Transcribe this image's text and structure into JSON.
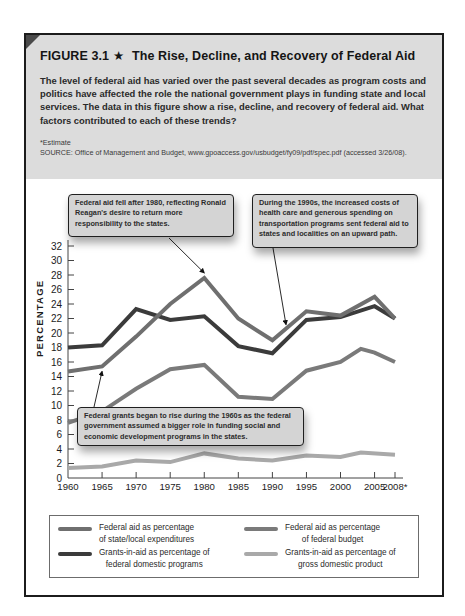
{
  "figure": {
    "number_label": "FIGURE 3.1",
    "star": "★",
    "title": "The Rise, Decline, and Recovery of Federal Aid",
    "description": "The level of federal aid has varied over the past several decades as program costs and politics have affected the role the national government plays in funding state and local services. The data in this figure show a rise, decline, and recovery of federal aid. What factors contributed to each of these trends?",
    "footnote": "*Estimate",
    "source": "SOURCE: Office of Management and Budget, www.gpoaccess.gov/usbudget/fy09/pdf/spec.pdf (accessed 3/26/08)."
  },
  "callouts": [
    {
      "text": "Federal aid fell after 1980, reflecting Ronald Reagan's desire to return more responsibility to the states.",
      "points_to": {
        "series": "Federal aid as percentage of state/local expenditures",
        "x": 1980
      }
    },
    {
      "text": "During the 1990s, the increased costs of health care and generous spending on transportation programs sent federal aid to states and localities on an upward path.",
      "points_to": {
        "series": "Federal aid as percentage of state/local expenditures",
        "x": 1992
      }
    },
    {
      "text": "Federal grants began to rise during the 1960s as the federal government assumed a bigger role in funding social and economic development programs in the states.",
      "points_to": {
        "series": "Federal aid as percentage of state/local expenditures",
        "x": 1965
      }
    }
  ],
  "chart_data": {
    "type": "line",
    "title": "The Rise, Decline, and Recovery of Federal Aid",
    "xlabel": "",
    "ylabel": "PERCENTAGE",
    "xlim": [
      1960,
      2008
    ],
    "ylim": [
      0,
      32
    ],
    "x_ticks": [
      1960,
      1965,
      1970,
      1975,
      1980,
      1985,
      1990,
      1995,
      2000,
      2005,
      2008
    ],
    "x_tick_labels": [
      "1960",
      "1965",
      "1970",
      "1975",
      "1980",
      "1985",
      "1990",
      "1995",
      "2000",
      "2005",
      "2008*"
    ],
    "y_ticks": [
      0,
      2,
      4,
      6,
      8,
      10,
      12,
      14,
      16,
      18,
      20,
      22,
      24,
      26,
      28,
      30,
      32
    ],
    "y_tick_labels": [
      "0",
      "2",
      "4",
      "6",
      "8",
      "10",
      "12",
      "14",
      "16",
      "18",
      "20",
      "22",
      "24",
      "26",
      "28",
      "30",
      "32"
    ],
    "grid": false,
    "legend_position": "bottom",
    "series": [
      {
        "name": "Federal aid as percentage of state/local expenditures",
        "legend_lines": [
          "Federal aid as percentage",
          "of state/local expenditures"
        ],
        "color": "#6f6f6f",
        "points": [
          [
            1960,
            14.7
          ],
          [
            1965,
            15.4
          ],
          [
            1970,
            19.5
          ],
          [
            1975,
            24.0
          ],
          [
            1980,
            27.6
          ],
          [
            1985,
            22.0
          ],
          [
            1990,
            19.0
          ],
          [
            1995,
            23.0
          ],
          [
            2000,
            22.4
          ],
          [
            2005,
            25.0
          ],
          [
            2008,
            22.0
          ]
        ]
      },
      {
        "name": "Grants-in-aid as percentage of federal domestic programs",
        "legend_lines": [
          "Grants-in-aid as percentage of",
          "federal domestic programs"
        ],
        "color": "#3b3b3b",
        "points": [
          [
            1960,
            18.0
          ],
          [
            1965,
            18.3
          ],
          [
            1970,
            23.3
          ],
          [
            1975,
            21.8
          ],
          [
            1980,
            22.3
          ],
          [
            1985,
            18.2
          ],
          [
            1990,
            17.2
          ],
          [
            1995,
            21.8
          ],
          [
            2000,
            22.2
          ],
          [
            2005,
            23.7
          ],
          [
            2008,
            22.0
          ]
        ]
      },
      {
        "name": "Federal aid as percentage of federal budget",
        "legend_lines": [
          "Federal aid as percentage",
          "of federal budget"
        ],
        "color": "#7a7a7a",
        "points": [
          [
            1960,
            7.6
          ],
          [
            1965,
            9.2
          ],
          [
            1970,
            12.3
          ],
          [
            1975,
            15.0
          ],
          [
            1980,
            15.6
          ],
          [
            1985,
            11.2
          ],
          [
            1990,
            10.9
          ],
          [
            1995,
            14.8
          ],
          [
            2000,
            16.0
          ],
          [
            2003,
            17.8
          ],
          [
            2005,
            17.3
          ],
          [
            2008,
            16.0
          ]
        ]
      },
      {
        "name": "Grants-in-aid as percentage of gross domestic product",
        "legend_lines": [
          "Grants-in-aid as percentage of",
          "gross domestic product"
        ],
        "color": "#a9a9a9",
        "points": [
          [
            1960,
            1.4
          ],
          [
            1965,
            1.6
          ],
          [
            1970,
            2.4
          ],
          [
            1975,
            2.2
          ],
          [
            1980,
            3.4
          ],
          [
            1985,
            2.7
          ],
          [
            1990,
            2.4
          ],
          [
            1995,
            3.1
          ],
          [
            2000,
            2.9
          ],
          [
            2003,
            3.5
          ],
          [
            2008,
            3.2
          ]
        ]
      }
    ]
  }
}
